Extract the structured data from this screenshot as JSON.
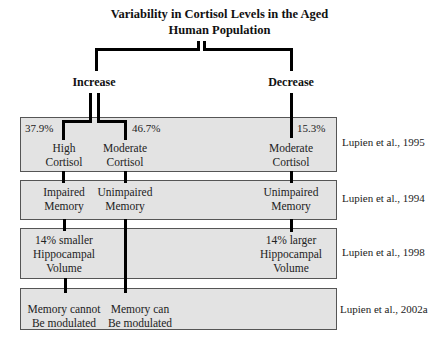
{
  "title_line1": "Variability in Cortisol Levels in the Aged",
  "title_line2": "Human Population",
  "categories": {
    "increase": "Increase",
    "decrease": "Decrease"
  },
  "rows": [
    {
      "reference": "Lupien et al., 1995",
      "cells": {
        "high": {
          "percent": "37.9%",
          "line1": "High",
          "line2": "Cortisol"
        },
        "moderate_inc": {
          "percent": "46.7%",
          "line1": "Moderate",
          "line2": "Cortisol"
        },
        "moderate_dec": {
          "percent": "15.3%",
          "line1": "Moderate",
          "line2": "Cortisol"
        }
      }
    },
    {
      "reference": "Lupien et al., 1994",
      "cells": {
        "high": {
          "line1": "Impaired",
          "line2": "Memory"
        },
        "moderate_inc": {
          "line1": "Unimpaired",
          "line2": "Memory"
        },
        "moderate_dec": {
          "line1": "Unimpaired",
          "line2": "Memory"
        }
      }
    },
    {
      "reference": "Lupien et al., 1998",
      "cells": {
        "high": {
          "line1": "14% smaller",
          "line2": "Hippocampal",
          "line3": "Volume"
        },
        "moderate_dec": {
          "line1": "14% larger",
          "line2": "Hippocampal",
          "line3": "Volume"
        }
      }
    },
    {
      "reference": "Lupien et al., 2002a",
      "cells": {
        "high": {
          "line1": "Memory cannot",
          "line2": "Be modulated"
        },
        "moderate_inc": {
          "line1": "Memory can",
          "line2": "Be modulated"
        }
      }
    }
  ]
}
